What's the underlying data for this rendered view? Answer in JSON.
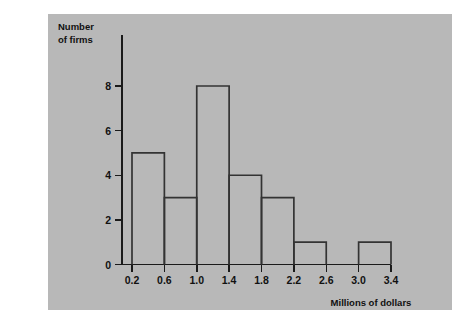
{
  "figure": {
    "panel_background": "#b8b8b8",
    "page_background": "#ffffff",
    "ink_color": "#1a1a1a",
    "bar_stroke_color": "#333333"
  },
  "chart_data": {
    "type": "bar",
    "title": "",
    "subtitle": "",
    "xlabel": "Millions of dollars",
    "ylabel_line1": "Number",
    "ylabel_line2": "of firms",
    "ylabel": "Number of firms",
    "histogram": true,
    "bin_width": 0.4,
    "bin_edges": [
      0.2,
      0.6,
      1.0,
      1.4,
      1.8,
      2.2,
      2.6,
      3.0,
      3.4
    ],
    "categories": [
      "0.2-0.6",
      "0.6-1.0",
      "1.0-1.4",
      "1.4-1.8",
      "1.8-2.2",
      "2.2-2.6",
      "2.6-3.0",
      "3.0-3.4"
    ],
    "values": [
      5,
      3,
      8,
      4,
      3,
      1,
      0,
      1
    ],
    "bars": [
      {
        "left": 0.2,
        "right": 0.6,
        "value": 5
      },
      {
        "left": 0.6,
        "right": 1.0,
        "value": 3
      },
      {
        "left": 1.0,
        "right": 1.4,
        "value": 8
      },
      {
        "left": 1.4,
        "right": 1.8,
        "value": 4
      },
      {
        "left": 1.8,
        "right": 2.2,
        "value": 3
      },
      {
        "left": 2.2,
        "right": 2.6,
        "value": 1
      },
      {
        "left": 2.6,
        "right": 3.0,
        "value": 0
      },
      {
        "left": 3.0,
        "right": 3.4,
        "value": 1
      }
    ],
    "xticks": [
      0.2,
      0.6,
      1.0,
      1.4,
      1.8,
      2.2,
      2.6,
      3.0,
      3.4
    ],
    "xtick_labels": [
      "0.2",
      "0.6",
      "1.0",
      "1.4",
      "1.8",
      "2.2",
      "2.6",
      "3.0",
      "3.4"
    ],
    "yticks": [
      0,
      2,
      4,
      6,
      8
    ],
    "ytick_labels": [
      "0",
      "2",
      "4",
      "6",
      "8"
    ],
    "xlim": [
      0.2,
      3.4
    ],
    "ylim": [
      0,
      8
    ],
    "grid": false,
    "legend": null,
    "legend_position": "none",
    "total_firms": 25
  },
  "axis_labels": {
    "y_title_line1": "Number",
    "y_title_line2": "of firms",
    "x_title": "Millions of dollars"
  },
  "ytick_values": {
    "t0": "0",
    "t1": "2",
    "t2": "4",
    "t3": "6",
    "t4": "8"
  },
  "xtick_values": {
    "t0": "0.2",
    "t1": "0.6",
    "t2": "1.0",
    "t3": "1.4",
    "t4": "1.8",
    "t5": "2.2",
    "t6": "2.6",
    "t7": "3.0",
    "t8": "3.4"
  }
}
